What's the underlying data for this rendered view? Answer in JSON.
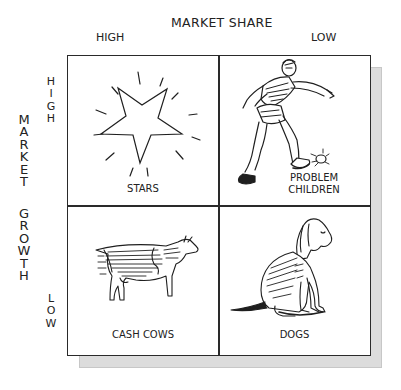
{
  "x_axis": {
    "title": "MARKET SHARE",
    "high_label": "HIGH",
    "low_label": "LOW"
  },
  "y_axis": {
    "title_word1": [
      "M",
      "A",
      "R",
      "K",
      "E",
      "T"
    ],
    "title_word2": [
      "G",
      "R",
      "O",
      "W",
      "T",
      "H"
    ],
    "high_label": [
      "H",
      "I",
      "G",
      "H"
    ],
    "low_label": [
      "L",
      "O",
      "W"
    ]
  },
  "quadrants": {
    "top_left": {
      "label": "STARS",
      "icon": "star-icon"
    },
    "top_right": {
      "label_line1": "PROBLEM",
      "label_line2": "CHILDREN",
      "icon": "kicking-child-icon"
    },
    "bottom_left": {
      "label": "CASH COWS",
      "icon": "cow-icon"
    },
    "bottom_right": {
      "label": "DOGS",
      "icon": "dog-icon"
    }
  },
  "colors": {
    "border": "#2a2a2a",
    "shadow": "#dcdcdc",
    "background": "#ffffff"
  }
}
